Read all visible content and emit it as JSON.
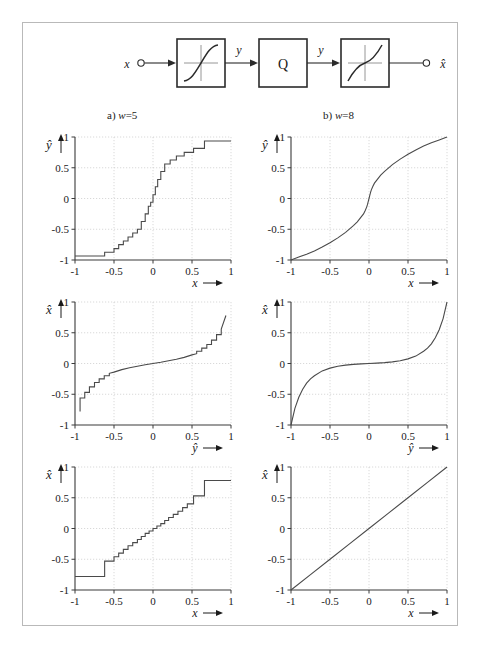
{
  "figure": {
    "background": "#ffffff",
    "border_color": "#b9b9b9",
    "line_color": "#4a4a4a",
    "grid_color": "#c9c9c9"
  },
  "block_diagram": {
    "input_label": "x",
    "output_label": "x̂",
    "signal_label_1": "y",
    "signal_label_2": "y",
    "blocks": [
      {
        "name": "compressor",
        "label": "",
        "icon": "sigmoid-curve-icon"
      },
      {
        "name": "quantizer",
        "label": "Q",
        "icon": "q-block"
      },
      {
        "name": "expander",
        "label": "",
        "icon": "inverse-sigmoid-curve-icon"
      }
    ]
  },
  "columns": [
    {
      "id": "a",
      "prefix": "a)",
      "param": "w",
      "equals": "=",
      "value": "5",
      "caption": "a) w = 5"
    },
    {
      "id": "b",
      "prefix": "b)",
      "param": "w",
      "equals": "=",
      "value": "8",
      "caption": "b) w = 8"
    }
  ],
  "axis": {
    "ticks": [
      "-1",
      "-0.5",
      "0",
      "0.5",
      "1"
    ],
    "tick_values": [
      -1,
      -0.5,
      0,
      0.5,
      1
    ],
    "arrow": "→"
  },
  "chart_data": [
    {
      "id": "a-compressor",
      "type": "line",
      "title": "a) w = 5",
      "xlabel": "x",
      "ylabel": "ŷ",
      "xlim": [
        -1,
        1
      ],
      "ylim": [
        -1,
        1
      ],
      "xticks": [
        -1,
        -0.5,
        0,
        0.5,
        1
      ],
      "yticks": [
        -1,
        -0.5,
        0,
        0.5,
        1
      ],
      "grid": true,
      "legend": "none",
      "note": "quantized (staircase) A-law type compressor characteristic, w = 5 bit",
      "series": [
        {
          "name": "y_hat(x) quantized",
          "x": [
            -1.0,
            -0.9,
            -0.8,
            -0.7,
            -0.62,
            -0.62,
            -0.5,
            -0.5,
            -0.44,
            -0.44,
            -0.38,
            -0.38,
            -0.32,
            -0.32,
            -0.26,
            -0.26,
            -0.2,
            -0.2,
            -0.15,
            -0.15,
            -0.1,
            -0.1,
            -0.06,
            -0.06,
            -0.03,
            -0.03,
            0.0,
            0.0,
            0.03,
            0.03,
            0.06,
            0.06,
            0.1,
            0.1,
            0.15,
            0.15,
            0.22,
            0.22,
            0.3,
            0.3,
            0.4,
            0.4,
            0.52,
            0.52,
            0.66,
            0.66,
            1.0
          ],
          "y": [
            -0.935,
            -0.935,
            -0.935,
            -0.935,
            -0.935,
            -0.875,
            -0.875,
            -0.815,
            -0.815,
            -0.75,
            -0.75,
            -0.69,
            -0.69,
            -0.625,
            -0.625,
            -0.56,
            -0.56,
            -0.5,
            -0.5,
            -0.375,
            -0.375,
            -0.25,
            -0.25,
            -0.125,
            -0.125,
            -0.06,
            -0.06,
            0.06,
            0.06,
            0.19,
            0.19,
            0.31,
            0.31,
            0.44,
            0.44,
            0.56,
            0.56,
            0.625,
            0.625,
            0.69,
            0.69,
            0.75,
            0.75,
            0.815,
            0.815,
            0.935,
            0.935
          ]
        }
      ]
    },
    {
      "id": "b-compressor",
      "type": "line",
      "title": "b) w = 8",
      "xlabel": "x",
      "ylabel": "ŷ",
      "xlim": [
        -1,
        1
      ],
      "ylim": [
        -1,
        1
      ],
      "xticks": [
        -1,
        -0.5,
        0,
        0.5,
        1
      ],
      "yticks": [
        -1,
        -0.5,
        0,
        0.5,
        1
      ],
      "grid": true,
      "legend": "none",
      "note": "smooth compressor characteristic, w = 8 bit",
      "series": [
        {
          "name": "y_hat(x)",
          "x": [
            -1.0,
            -0.9,
            -0.8,
            -0.7,
            -0.6,
            -0.5,
            -0.4,
            -0.3,
            -0.2,
            -0.15,
            -0.1,
            -0.07,
            -0.05,
            -0.03,
            -0.02,
            -0.01,
            0.0,
            0.01,
            0.02,
            0.03,
            0.05,
            0.07,
            0.1,
            0.15,
            0.2,
            0.3,
            0.4,
            0.5,
            0.6,
            0.7,
            0.8,
            0.9,
            1.0
          ],
          "y": [
            -1.0,
            -0.952,
            -0.905,
            -0.852,
            -0.79,
            -0.72,
            -0.64,
            -0.55,
            -0.44,
            -0.38,
            -0.3,
            -0.25,
            -0.2,
            -0.14,
            -0.1,
            -0.05,
            0.0,
            0.05,
            0.1,
            0.14,
            0.2,
            0.25,
            0.3,
            0.38,
            0.44,
            0.55,
            0.64,
            0.72,
            0.79,
            0.852,
            0.905,
            0.952,
            1.0
          ]
        }
      ]
    },
    {
      "id": "a-expander",
      "type": "line",
      "title": "a) w = 5",
      "xlabel": "ŷ",
      "ylabel": "x̂",
      "xlim": [
        -1,
        1
      ],
      "ylim": [
        -1,
        1
      ],
      "xticks": [
        -1,
        -0.5,
        0,
        0.5,
        1
      ],
      "yticks": [
        -1,
        -0.5,
        0,
        0.5,
        1
      ],
      "grid": true,
      "legend": "none",
      "note": "quantized expander (inverse) characteristic, w = 5 bit",
      "series": [
        {
          "name": "x_hat(y_hat) quantized",
          "x": [
            -0.935,
            -0.935,
            -0.875,
            -0.875,
            -0.815,
            -0.815,
            -0.75,
            -0.75,
            -0.69,
            -0.69,
            -0.625,
            -0.625,
            -0.56,
            -0.56,
            -0.5,
            -0.4,
            -0.3,
            -0.2,
            -0.1,
            0.0,
            0.1,
            0.2,
            0.3,
            0.4,
            0.5,
            0.56,
            0.56,
            0.625,
            0.625,
            0.69,
            0.69,
            0.75,
            0.75,
            0.815,
            0.815,
            0.875,
            0.875,
            0.935
          ],
          "y": [
            -0.78,
            -0.56,
            -0.56,
            -0.47,
            -0.47,
            -0.38,
            -0.38,
            -0.31,
            -0.31,
            -0.25,
            -0.25,
            -0.2,
            -0.2,
            -0.16,
            -0.14,
            -0.1,
            -0.07,
            -0.045,
            -0.02,
            0.0,
            0.02,
            0.045,
            0.07,
            0.1,
            0.14,
            0.16,
            0.2,
            0.2,
            0.25,
            0.25,
            0.31,
            0.31,
            0.38,
            0.38,
            0.47,
            0.47,
            0.56,
            0.78
          ]
        }
      ]
    },
    {
      "id": "b-expander",
      "type": "line",
      "title": "b) w = 8",
      "xlabel": "ŷ",
      "ylabel": "x̂",
      "xlim": [
        -1,
        1
      ],
      "ylim": [
        -1,
        1
      ],
      "xticks": [
        -1,
        -0.5,
        0,
        0.5,
        1
      ],
      "yticks": [
        -1,
        -0.5,
        0,
        0.5,
        1
      ],
      "grid": true,
      "legend": "none",
      "note": "smooth expander (inverse) characteristic, w = 8 bit",
      "series": [
        {
          "name": "x_hat(y_hat)",
          "x": [
            -1.0,
            -0.95,
            -0.9,
            -0.85,
            -0.8,
            -0.75,
            -0.7,
            -0.6,
            -0.5,
            -0.4,
            -0.3,
            -0.2,
            -0.1,
            0.0,
            0.1,
            0.2,
            0.3,
            0.4,
            0.5,
            0.6,
            0.7,
            0.75,
            0.8,
            0.85,
            0.9,
            0.95,
            1.0
          ],
          "y": [
            -1.0,
            -0.73,
            -0.55,
            -0.42,
            -0.32,
            -0.25,
            -0.2,
            -0.12,
            -0.075,
            -0.045,
            -0.026,
            -0.014,
            -0.006,
            0.0,
            0.006,
            0.014,
            0.026,
            0.045,
            0.075,
            0.12,
            0.2,
            0.25,
            0.32,
            0.42,
            0.55,
            0.73,
            1.0
          ]
        }
      ]
    },
    {
      "id": "a-overall",
      "type": "line",
      "title": "a) w = 5",
      "xlabel": "x",
      "ylabel": "x̂",
      "xlim": [
        -1,
        1
      ],
      "ylim": [
        -1,
        1
      ],
      "xticks": [
        -1,
        -0.5,
        0,
        0.5,
        1
      ],
      "yticks": [
        -1,
        -0.5,
        0,
        0.5,
        1
      ],
      "grid": true,
      "legend": "none",
      "note": "overall staircase transfer characteristic x_hat(x), w = 5 bit",
      "series": [
        {
          "name": "x_hat(x) staircase",
          "x": [
            -1.0,
            -0.62,
            -0.62,
            -0.5,
            -0.5,
            -0.44,
            -0.44,
            -0.38,
            -0.38,
            -0.32,
            -0.32,
            -0.26,
            -0.26,
            -0.2,
            -0.2,
            -0.15,
            -0.15,
            -0.1,
            -0.1,
            -0.05,
            -0.05,
            0.0,
            0.0,
            0.05,
            0.05,
            0.1,
            0.1,
            0.15,
            0.15,
            0.2,
            0.2,
            0.26,
            0.26,
            0.32,
            0.32,
            0.38,
            0.38,
            0.44,
            0.44,
            0.52,
            0.52,
            0.66,
            0.66,
            1.0
          ],
          "y": [
            -0.78,
            -0.78,
            -0.53,
            -0.53,
            -0.46,
            -0.46,
            -0.4,
            -0.4,
            -0.34,
            -0.34,
            -0.28,
            -0.28,
            -0.23,
            -0.23,
            -0.18,
            -0.18,
            -0.13,
            -0.13,
            -0.08,
            -0.08,
            -0.04,
            -0.04,
            0.0,
            0.0,
            0.04,
            0.04,
            0.08,
            0.08,
            0.13,
            0.13,
            0.18,
            0.18,
            0.23,
            0.23,
            0.28,
            0.28,
            0.34,
            0.34,
            0.4,
            0.4,
            0.53,
            0.53,
            0.78,
            0.78
          ]
        }
      ]
    },
    {
      "id": "b-overall",
      "type": "line",
      "title": "b) w = 8",
      "xlabel": "x",
      "ylabel": "x̂",
      "xlim": [
        -1,
        1
      ],
      "ylim": [
        -1,
        1
      ],
      "xticks": [
        -1,
        -0.5,
        0,
        0.5,
        1
      ],
      "yticks": [
        -1,
        -0.5,
        0,
        0.5,
        1
      ],
      "grid": true,
      "legend": "none",
      "note": "overall transfer characteristic x_hat(x) approaches identity, w = 8 bit",
      "series": [
        {
          "name": "x_hat(x) near-identity",
          "x": [
            -1.0,
            -0.75,
            -0.5,
            -0.25,
            0.0,
            0.25,
            0.5,
            0.75,
            1.0
          ],
          "y": [
            -1.0,
            -0.75,
            -0.5,
            -0.25,
            0.0,
            0.25,
            0.5,
            0.75,
            1.0
          ]
        }
      ]
    }
  ]
}
